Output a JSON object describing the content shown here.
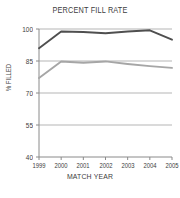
{
  "chart_data": {
    "type": "line",
    "title": "PERCENT FILL RATE",
    "xlabel": "MATCH YEAR",
    "ylabel": "% FILLED",
    "categories": [
      "1999",
      "2000",
      "2001",
      "2002",
      "2003",
      "2004",
      "2005"
    ],
    "x": [
      1999,
      2000,
      2001,
      2002,
      2003,
      2004,
      2005
    ],
    "series": [
      {
        "name": "upper-series",
        "color": "#4f4f4f",
        "values": [
          91.0,
          98.8,
          98.6,
          98.0,
          98.8,
          99.4,
          95.0
        ]
      },
      {
        "name": "lower-series",
        "color": "#a6a6a6",
        "values": [
          77.0,
          84.8,
          84.2,
          84.8,
          83.6,
          82.6,
          81.8
        ]
      }
    ],
    "ylim": [
      40,
      100
    ],
    "yticks": [
      40,
      55,
      70,
      85,
      100
    ],
    "ytick_labels": [
      "40",
      "55",
      "70",
      "85",
      "100"
    ],
    "xtick_labels": [
      "1999",
      "2000",
      "2001",
      "2002",
      "2003",
      "2004",
      "2005"
    ],
    "grid": true,
    "gridlines_y": [
      55,
      70,
      85,
      100
    ],
    "legend": "none",
    "background": "#ffffff",
    "axis_color": "#8a8a8a",
    "grid_color": "#b5b5b5"
  }
}
